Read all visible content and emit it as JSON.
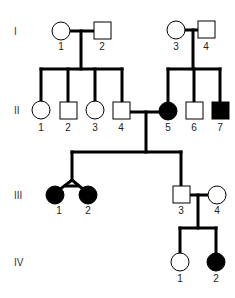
{
  "diagram": {
    "type": "pedigree",
    "colors": {
      "affected": "#000000",
      "unaffected": "#ffffff",
      "line": "#000000"
    },
    "generations": [
      {
        "label": "I",
        "individuals": [
          {
            "id": "I-1",
            "number": "1",
            "sex": "female",
            "affected": false
          },
          {
            "id": "I-2",
            "number": "2",
            "sex": "male",
            "affected": false
          },
          {
            "id": "I-3",
            "number": "3",
            "sex": "female",
            "affected": false
          },
          {
            "id": "I-4",
            "number": "4",
            "sex": "male",
            "affected": false
          }
        ]
      },
      {
        "label": "II",
        "individuals": [
          {
            "id": "II-1",
            "number": "1",
            "sex": "female",
            "affected": false
          },
          {
            "id": "II-2",
            "number": "2",
            "sex": "male",
            "affected": false
          },
          {
            "id": "II-3",
            "number": "3",
            "sex": "female",
            "affected": false
          },
          {
            "id": "II-4",
            "number": "4",
            "sex": "male",
            "affected": false
          },
          {
            "id": "II-5",
            "number": "5",
            "sex": "female",
            "affected": true
          },
          {
            "id": "II-6",
            "number": "6",
            "sex": "male",
            "affected": false
          },
          {
            "id": "II-7",
            "number": "7",
            "sex": "male",
            "affected": true
          }
        ]
      },
      {
        "label": "III",
        "individuals": [
          {
            "id": "III-1",
            "number": "1",
            "sex": "female",
            "affected": true,
            "twin": "monozygotic"
          },
          {
            "id": "III-2",
            "number": "2",
            "sex": "female",
            "affected": true,
            "twin": "monozygotic"
          },
          {
            "id": "III-3",
            "number": "3",
            "sex": "male",
            "affected": false
          },
          {
            "id": "III-4",
            "number": "4",
            "sex": "female",
            "affected": false
          }
        ]
      },
      {
        "label": "IV",
        "individuals": [
          {
            "id": "IV-1",
            "number": "1",
            "sex": "female",
            "affected": false
          },
          {
            "id": "IV-2",
            "number": "2",
            "sex": "female",
            "affected": true
          }
        ]
      }
    ]
  }
}
